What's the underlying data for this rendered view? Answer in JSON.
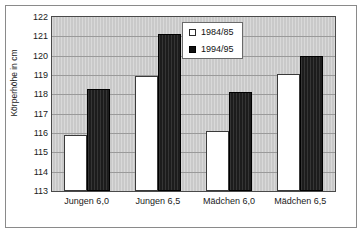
{
  "chart_data": {
    "type": "bar",
    "title": "",
    "xlabel": "",
    "ylabel": "Körperhöhe in cm",
    "ylim": [
      113,
      122
    ],
    "ytick_step": 1,
    "yticks": [
      122,
      121,
      120,
      119,
      118,
      117,
      116,
      115,
      114,
      113
    ],
    "grid": true,
    "legend_position": "top-center-right",
    "categories": [
      "Jungen 6,0",
      "Jungen 6,5",
      "Mädchen 6,0",
      "Mädchen 6,5"
    ],
    "series": [
      {
        "name": "1984/85",
        "color": "#ffffff",
        "values": [
          115.9,
          118.95,
          116.1,
          119.05
        ]
      },
      {
        "name": "1994/95",
        "color": "#1c1c1c",
        "values": [
          118.3,
          121.1,
          118.1,
          120.0
        ]
      }
    ]
  },
  "plot": {
    "background_color": "#c9c9c9",
    "border_color": "#4a4a4a",
    "gridline_color": "#9a9a9a"
  },
  "frame": {
    "border_color": "#8a8a8a",
    "background_color": "#ffffff"
  }
}
